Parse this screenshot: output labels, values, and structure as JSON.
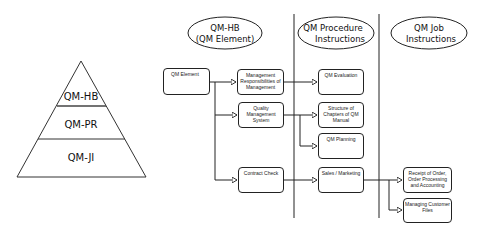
{
  "pyramid": {
    "levels": [
      {
        "label": "QM-HB"
      },
      {
        "label": "QM-PR"
      },
      {
        "label": "QM-JI"
      }
    ]
  },
  "columns": [
    {
      "line1": "QM-HB",
      "line2": "(QM Element)"
    },
    {
      "line1": "QM Procedure",
      "line2": "Instructions"
    },
    {
      "line1": "QM Job",
      "line2": "Instructions"
    }
  ],
  "boxes": {
    "qm_element": "QM Element",
    "mgmt_responsibilities": "Management Responsibilities of Management",
    "quality_mgmt_system": "Quality Management System",
    "contract_check": "Contract Check",
    "qm_evaluation": "QM Evaluation",
    "structure_chapters": "Structure of Chapters of QM Manual",
    "qm_planning": "QM Planning",
    "sales_marketing": "Sales / Marketing",
    "receipt_order": "Receipt of Order, Order Processing and Accounting",
    "managing_customer_files": "Managing Customer Files"
  },
  "colors": {
    "line": "#222222",
    "pyramid_line": "#333333",
    "background": "#ffffff"
  }
}
